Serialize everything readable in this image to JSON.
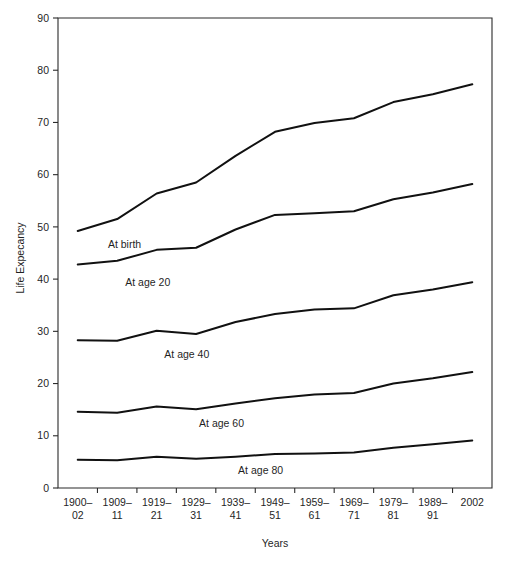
{
  "chart_data": {
    "type": "line",
    "title": "",
    "xlabel": "Years",
    "ylabel": "Life Expecancy",
    "ylim": [
      0,
      90
    ],
    "ytick_step": 10,
    "grid": false,
    "legend_position": "inline-labels",
    "categories": [
      "1900–02",
      "1909–11",
      "1919–21",
      "1929–31",
      "1939–41",
      "1949–51",
      "1959–61",
      "1969–71",
      "1979–81",
      "1989–91",
      "2002"
    ],
    "category_lines": [
      [
        "1900–",
        "02"
      ],
      [
        "1909–",
        "11"
      ],
      [
        "1919–",
        "21"
      ],
      [
        "1929–",
        "31"
      ],
      [
        "1939–",
        "41"
      ],
      [
        "1949–",
        "51"
      ],
      [
        "1959–",
        "61"
      ],
      [
        "1969–",
        "71"
      ],
      [
        "1979–",
        "81"
      ],
      [
        "1989–",
        "91"
      ],
      [
        "2002",
        ""
      ]
    ],
    "yticks": [
      0,
      10,
      20,
      30,
      40,
      50,
      60,
      70,
      80,
      90
    ],
    "series": [
      {
        "name": "At birth",
        "label": "At birth",
        "color": "#111111",
        "values": [
          49.2,
          51.5,
          56.4,
          58.5,
          63.6,
          68.2,
          69.9,
          70.8,
          73.9,
          75.4,
          77.3
        ]
      },
      {
        "name": "At age 20",
        "label": "At age 20",
        "color": "#111111",
        "values": [
          42.8,
          43.5,
          45.6,
          46.0,
          49.5,
          52.3,
          52.6,
          53.0,
          55.3,
          56.6,
          58.2
        ]
      },
      {
        "name": "At age 40",
        "label": "At age 40",
        "color": "#111111",
        "values": [
          28.3,
          28.2,
          30.1,
          29.5,
          31.8,
          33.3,
          34.2,
          34.4,
          36.9,
          38.0,
          39.4
        ]
      },
      {
        "name": "At age 60",
        "label": "At age 60",
        "color": "#111111",
        "values": [
          14.6,
          14.4,
          15.6,
          15.1,
          16.2,
          17.2,
          17.9,
          18.2,
          20.0,
          21.0,
          22.2
        ]
      },
      {
        "name": "At age 80",
        "label": "At age 80",
        "color": "#111111",
        "values": [
          5.4,
          5.3,
          6.0,
          5.6,
          6.0,
          6.5,
          6.6,
          6.8,
          7.7,
          8.4,
          9.1
        ]
      }
    ],
    "series_label_positions": [
      {
        "name": "At birth",
        "x_frac": 0.115,
        "y_value": 46.0
      },
      {
        "name": "At age 20",
        "x_frac": 0.155,
        "y_value": 38.6
      },
      {
        "name": "At age 40",
        "x_frac": 0.245,
        "y_value": 24.8
      },
      {
        "name": "At age 60",
        "x_frac": 0.325,
        "y_value": 11.6
      },
      {
        "name": "At age 80",
        "x_frac": 0.415,
        "y_value": 2.6
      }
    ]
  }
}
